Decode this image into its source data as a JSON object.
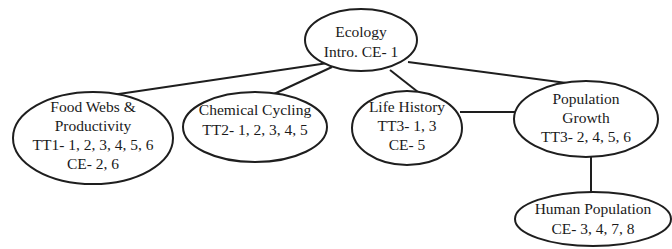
{
  "diagram": {
    "type": "concept-map",
    "nodes": {
      "ecology": {
        "lines": [
          "Ecology",
          "Intro. CE- 1"
        ]
      },
      "food_webs": {
        "lines": [
          "Food Webs &",
          "Productivity",
          "TT1- 1, 2, 3, 4, 5, 6",
          "CE- 2, 6"
        ]
      },
      "chemical_cycling": {
        "lines": [
          "Chemical Cycling",
          "TT2- 1, 2, 3, 4, 5"
        ]
      },
      "life_history": {
        "lines": [
          "Life History",
          "TT3- 1, 3",
          "CE- 5"
        ]
      },
      "population_growth": {
        "lines": [
          "Population",
          "Growth",
          "TT3- 2, 4, 5, 6"
        ]
      },
      "human_population": {
        "lines": [
          "Human Population",
          "CE- 3, 4, 7, 8"
        ]
      }
    },
    "edges": [
      {
        "from": "ecology",
        "to": "food_webs"
      },
      {
        "from": "ecology",
        "to": "chemical_cycling"
      },
      {
        "from": "ecology",
        "to": "life_history"
      },
      {
        "from": "ecology",
        "to": "population_growth"
      },
      {
        "from": "life_history",
        "to": "population_growth"
      },
      {
        "from": "population_growth",
        "to": "human_population"
      }
    ],
    "colors": {
      "stroke": "#1e1e1e",
      "text": "#1a1a1a",
      "background": "#ffffff"
    }
  }
}
